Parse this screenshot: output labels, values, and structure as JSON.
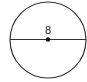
{
  "diagram": {
    "shape": "circle",
    "center": {
      "x": 48,
      "y": 40
    },
    "radius": 38,
    "diameter_line": true,
    "center_point": true,
    "label": "8",
    "label_meaning": "diameter length",
    "colors": {
      "stroke": "#333333",
      "fill": "#ffffff",
      "point": "#111111"
    }
  }
}
